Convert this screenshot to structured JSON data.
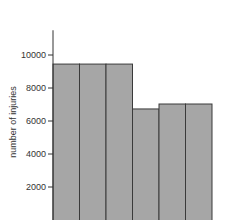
{
  "chart_data": {
    "type": "bar",
    "title": "",
    "xlabel": "",
    "ylabel": "number of injuries",
    "categories": [
      "1",
      "2",
      "3",
      "4",
      "5",
      "6"
    ],
    "values": [
      9450,
      9450,
      9450,
      6730,
      7030,
      7030
    ],
    "yticks": [
      2000,
      4000,
      6000,
      8000,
      10000
    ],
    "ylim": [
      0,
      11500
    ],
    "grid": false,
    "bar_color": "#a6a6a6",
    "edge_color": "#3a3a3a"
  }
}
